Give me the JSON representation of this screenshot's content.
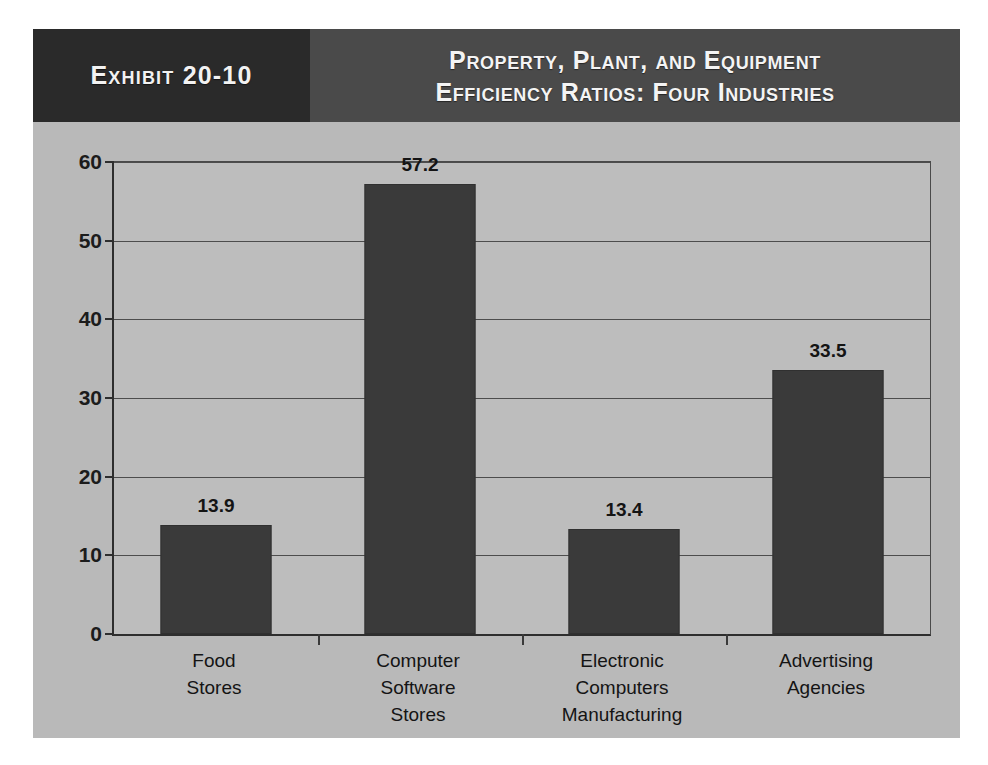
{
  "exhibit": {
    "label": "Exhibit 20-10",
    "title_line1": "Property, Plant, and Equipment",
    "title_line2": "Efficiency Ratios: Four Industries"
  },
  "colors": {
    "header_dark": "#2a2a2a",
    "header_mid": "#4a4a4a",
    "body_background": "#b9b9b9",
    "plot_background": "#bdbdbd",
    "bar_fill": "#3a3a3a",
    "gridline": "#4d4d4d",
    "axis": "#2e2e2e",
    "text": "#141414",
    "header_text": "#f4f4f4"
  },
  "chart_data": {
    "type": "bar",
    "title": "Property, Plant, and Equipment Efficiency Ratios: Four Industries",
    "subtitle": "Exhibit 20-10",
    "xlabel": "",
    "ylabel": "",
    "categories": [
      "Food Stores",
      "Computer Software Stores",
      "Electronic Computers Manufacturing",
      "Advertising Agencies"
    ],
    "category_lines": [
      [
        "Food",
        "Stores"
      ],
      [
        "Computer",
        "Software",
        "Stores"
      ],
      [
        "Electronic",
        "Computers",
        "Manufacturing"
      ],
      [
        "Advertising",
        "Agencies"
      ]
    ],
    "values": [
      13.9,
      57.2,
      13.4,
      33.5
    ],
    "value_labels": [
      "13.9",
      "57.2",
      "13.4",
      "33.5"
    ],
    "ylim": [
      0,
      60
    ],
    "yticks": [
      0,
      10,
      20,
      30,
      40,
      50,
      60
    ],
    "ytick_labels": [
      "0",
      "10",
      "20",
      "30",
      "40",
      "50",
      "60"
    ],
    "grid": true,
    "grid_axis": "y",
    "legend": false,
    "legend_position": "none"
  }
}
